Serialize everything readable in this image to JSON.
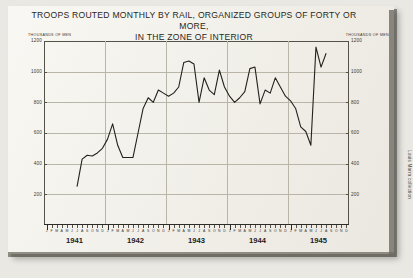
{
  "credit": "Louis Marra collection",
  "chart_data": {
    "type": "line",
    "title": "TROOPS ROUTED MONTHLY BY RAIL, ORGANIZED GROUPS OF FORTY OR MORE,",
    "subtitle": "IN THE ZONE OF INTERIOR",
    "ylabel_left": "THOUSANDS OF MEN",
    "ylabel_right": "THOUSANDS OF MEN",
    "xlabel": "",
    "grid": true,
    "legend": "none",
    "ylim": [
      0,
      1200
    ],
    "yticks": [
      1200,
      1000,
      800,
      600,
      400,
      200
    ],
    "years": [
      "1941",
      "1942",
      "1943",
      "1944",
      "1945"
    ],
    "month_letters": [
      "J",
      "F",
      "M",
      "A",
      "M",
      "J",
      "J",
      "A",
      "S",
      "O",
      "N",
      "D"
    ],
    "x": [
      "1941-07",
      "1941-08",
      "1941-09",
      "1941-10",
      "1941-11",
      "1941-12",
      "1942-01",
      "1942-02",
      "1942-03",
      "1942-04",
      "1942-05",
      "1942-06",
      "1942-07",
      "1942-08",
      "1942-09",
      "1942-10",
      "1942-11",
      "1942-12",
      "1943-01",
      "1943-02",
      "1943-03",
      "1943-04",
      "1943-05",
      "1943-06",
      "1943-07",
      "1943-08",
      "1943-09",
      "1943-10",
      "1943-11",
      "1943-12",
      "1944-01",
      "1944-02",
      "1944-03",
      "1944-04",
      "1944-05",
      "1944-06",
      "1944-07",
      "1944-08",
      "1944-09",
      "1944-10",
      "1944-11",
      "1944-12",
      "1945-01",
      "1945-02",
      "1945-03",
      "1945-04",
      "1945-05",
      "1945-06",
      "1945-07",
      "1945-08"
    ],
    "values": [
      250,
      430,
      455,
      450,
      470,
      500,
      560,
      660,
      520,
      440,
      440,
      440,
      600,
      760,
      830,
      800,
      880,
      860,
      840,
      860,
      900,
      1060,
      1070,
      1050,
      800,
      960,
      880,
      850,
      1010,
      900,
      840,
      800,
      830,
      870,
      1020,
      1030,
      790,
      880,
      860,
      960,
      900,
      840,
      810,
      760,
      640,
      610,
      520,
      1160,
      1030,
      1120
    ]
  }
}
